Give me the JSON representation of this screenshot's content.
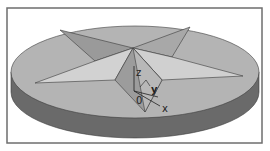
{
  "figure": {
    "axes": {
      "z_label": "z",
      "y_label": "y",
      "x_label": "x",
      "origin_label": "0"
    },
    "colors": {
      "frame": "#6e6e6e",
      "disk_top": "#b4b4b4",
      "disk_side": "#6a6a6a",
      "star_light": "#d2d2d2",
      "star_mid": "#a8a8a8",
      "star_dark": "#8e8e8e",
      "edge": "#3a3a3a"
    }
  }
}
